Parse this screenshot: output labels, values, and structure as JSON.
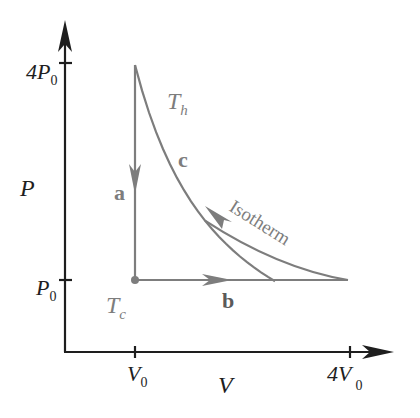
{
  "diagram": {
    "type": "PV thermodynamic cycle",
    "axes": {
      "x_label": "V",
      "y_label": "P",
      "x_ticks": [
        {
          "label_main": "V",
          "label_sub": "0",
          "value": "V0"
        },
        {
          "label_main": "4V",
          "label_sub": "0",
          "value": "4V0"
        }
      ],
      "y_ticks": [
        {
          "label_main": "P",
          "label_sub": "0",
          "value": "P0"
        },
        {
          "label_main": "4P",
          "label_sub": "0",
          "value": "4P0"
        }
      ]
    },
    "processes": [
      {
        "label": "a",
        "from": "(V0, 4P0)",
        "to": "(V0, P0)",
        "kind": "isochoric",
        "direction": "down"
      },
      {
        "label": "b",
        "from": "(V0, P0)",
        "to": "(4V0, P0)",
        "kind": "isobaric",
        "direction": "right"
      },
      {
        "label": "c",
        "from": "(4V0, P0)",
        "to": "(V0, 4P0)",
        "kind": "isothermal",
        "direction": "up-left"
      }
    ],
    "annotations": {
      "hot_temp_main": "T",
      "hot_temp_sub": "h",
      "cold_temp_main": "T",
      "cold_temp_sub": "c",
      "isotherm": "Isotherm"
    },
    "colors": {
      "axes": "#1e1e1e",
      "cycle": "#7d7d7d"
    }
  }
}
